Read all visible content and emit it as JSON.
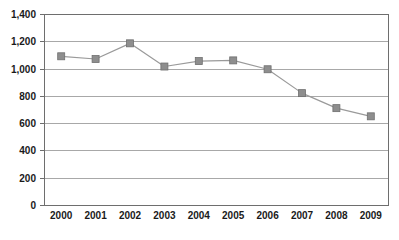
{
  "chart_data": {
    "type": "line",
    "title": "",
    "subtitle": "",
    "xlabel": "",
    "ylabel": "",
    "categories": [
      "2000",
      "2001",
      "2002",
      "2003",
      "2004",
      "2005",
      "2006",
      "2007",
      "2008",
      "2009"
    ],
    "series": [
      {
        "name": "Series 1",
        "values": [
          1090,
          1070,
          1185,
          1015,
          1055,
          1060,
          995,
          820,
          710,
          650
        ],
        "line_color": "#9a9a9a",
        "marker_color": "#8e8e8e",
        "marker_shape": "square"
      }
    ],
    "ylim": [
      0,
      1400
    ],
    "xlim_categories": true,
    "y_ticks": [
      0,
      200,
      400,
      600,
      800,
      1000,
      1200,
      1400
    ],
    "y_tick_labels": [
      "0",
      "200",
      "400",
      "600",
      "800",
      "1,000",
      "1,200",
      "1,400"
    ],
    "x_tick_labels": [
      "2000",
      "2001",
      "2002",
      "2003",
      "2004",
      "2005",
      "2006",
      "2007",
      "2008",
      "2009"
    ],
    "grid": {
      "horizontal": true,
      "vertical": false,
      "color": "#a8a8a8"
    },
    "legend": {
      "visible": false,
      "position": "none",
      "entries": []
    },
    "plot_frame_color": "#6e6e6e",
    "background_color": "#ffffff",
    "annotations": []
  },
  "chart_meta": {
    "plot_left": 44,
    "plot_top": 14,
    "plot_right": 388,
    "plot_bottom": 205
  }
}
